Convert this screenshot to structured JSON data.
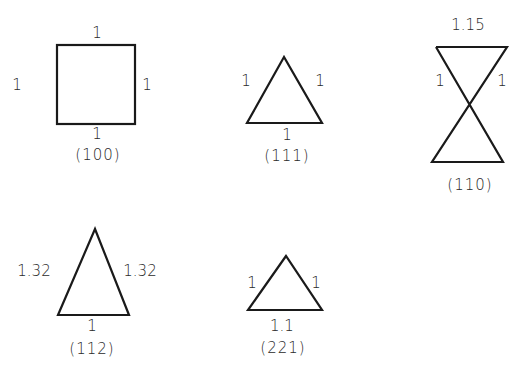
{
  "figure": {
    "panels": [
      {
        "id": "p100",
        "caption": "(100)",
        "shape": "square",
        "edge_labels": {
          "top": "1",
          "left": "1",
          "right": "1",
          "bottom": "1"
        }
      },
      {
        "id": "p111",
        "caption": "(111)",
        "shape": "equilateral-triangle",
        "edge_labels": {
          "left": "1",
          "right": "1",
          "bottom": "1"
        }
      },
      {
        "id": "p110",
        "caption": "(110)",
        "shape": "hourglass",
        "edge_labels": {
          "top": "1.15",
          "left": "1",
          "right": "1"
        }
      },
      {
        "id": "p112",
        "caption": "(112)",
        "shape": "isosceles-triangle",
        "edge_labels": {
          "left": "1.32",
          "right": "1.32",
          "bottom": "1"
        }
      },
      {
        "id": "p221",
        "caption": "(221)",
        "shape": "triangle",
        "edge_labels": {
          "left": "1",
          "right": "1",
          "bottom": "1.1"
        }
      }
    ],
    "colors": {
      "stroke": "#1a1a1a",
      "text": "#2a2a2a",
      "background": "#ffffff"
    }
  }
}
